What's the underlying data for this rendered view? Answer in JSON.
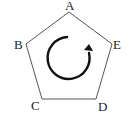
{
  "diagram": {
    "shape": "pentagon",
    "vertices": [
      {
        "label": "A",
        "x": 69,
        "y": 12
      },
      {
        "label": "E",
        "x": 112,
        "y": 44
      },
      {
        "label": "D",
        "x": 96,
        "y": 99
      },
      {
        "label": "C",
        "x": 42,
        "y": 99
      },
      {
        "label": "B",
        "x": 26,
        "y": 44
      }
    ],
    "rotation_arrow": {
      "direction": "clockwise",
      "icon": "rotate-clockwise-icon"
    },
    "colors": {
      "stroke": "#555555",
      "arrow": "#111111",
      "label": "#222222"
    }
  }
}
